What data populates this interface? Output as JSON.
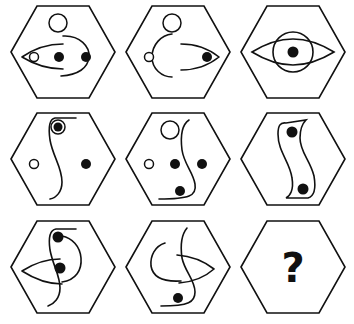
{
  "puzzle": {
    "type": "3x3 hexagon figure matrix",
    "rows": 3,
    "cols": 3,
    "stroke_color": "#111111",
    "background": "#ffffff",
    "cells": [
      {
        "row": 1,
        "col": 1,
        "elements": [
          "open-circle-top",
          "large-arc",
          "left-eye-shape",
          "small-open-circle",
          "filled-dot",
          "filled-dot"
        ]
      },
      {
        "row": 1,
        "col": 2,
        "elements": [
          "open-circle-top",
          "large-arc",
          "small-open-circle",
          "right-eye-shape",
          "filled-dot"
        ]
      },
      {
        "row": 1,
        "col": 3,
        "elements": [
          "eye-shape",
          "circle",
          "filled-dot"
        ]
      },
      {
        "row": 2,
        "col": 1,
        "elements": [
          "s-curve",
          "double-circle-dot",
          "small-open-circle",
          "filled-dot"
        ]
      },
      {
        "row": 2,
        "col": 2,
        "elements": [
          "open-circle-top",
          "s-curve",
          "small-open-circle",
          "filled-dot",
          "filled-dot",
          "filled-dot"
        ]
      },
      {
        "row": 2,
        "col": 3,
        "elements": [
          "s-band-shape",
          "filled-dot",
          "filled-dot"
        ]
      },
      {
        "row": 3,
        "col": 1,
        "elements": [
          "s-curve",
          "hook-curve",
          "left-eye-shape",
          "filled-dot",
          "filled-dot"
        ]
      },
      {
        "row": 3,
        "col": 2,
        "elements": [
          "c-curve",
          "s-curve",
          "right-eye-shape",
          "filled-dot"
        ]
      },
      {
        "row": 3,
        "col": 3,
        "elements": [
          "question-mark"
        ],
        "label": "?"
      }
    ]
  }
}
